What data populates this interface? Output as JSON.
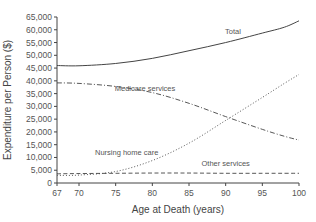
{
  "chart_data": {
    "type": "line",
    "title": "",
    "xlabel": "Age at Death (years)",
    "ylabel": "Expenditure per Person ($)",
    "xlim": [
      67,
      100
    ],
    "ylim": [
      0,
      65000
    ],
    "grid": false,
    "legend": "inline labels",
    "x_ticks": [
      67,
      70,
      75,
      80,
      85,
      90,
      95,
      100
    ],
    "x_tick_labels": [
      "67",
      "70",
      "75",
      "80",
      "85",
      "90",
      "95",
      "100"
    ],
    "y_ticks": [
      0,
      5000,
      10000,
      15000,
      20000,
      25000,
      30000,
      35000,
      40000,
      45000,
      50000,
      55000,
      60000,
      65000
    ],
    "y_tick_labels": [
      "0",
      "5,000",
      "10,000",
      "15,000",
      "20,000",
      "25,000",
      "30,000",
      "35,000",
      "40,000",
      "45,000",
      "50,000",
      "55,000",
      "60,000",
      "65,000"
    ],
    "x": [
      67,
      70,
      75,
      80,
      85,
      90,
      95,
      98,
      100
    ],
    "series": [
      {
        "name": "Total",
        "style": "solid",
        "values": [
          46000,
          45900,
          46800,
          48800,
          51800,
          55000,
          58700,
          61000,
          63500
        ]
      },
      {
        "name": "Medicare services",
        "style": "dash-dot",
        "values": [
          39200,
          39000,
          37800,
          35400,
          31200,
          26000,
          21000,
          18300,
          16800
        ]
      },
      {
        "name": "Nursing home care",
        "style": "dotted",
        "values": [
          3000,
          3100,
          4500,
          8800,
          15600,
          24500,
          33500,
          39000,
          42500
        ]
      },
      {
        "name": "Other services",
        "style": "dashed",
        "values": [
          3600,
          3700,
          3800,
          3900,
          3900,
          3800,
          3800,
          3800,
          3800
        ]
      }
    ],
    "annotations": [
      {
        "text": "Total",
        "x": 91,
        "y": 58500
      },
      {
        "text": "Medicare services",
        "x": 79,
        "y": 36000
      },
      {
        "text": "Nursing home care",
        "x": 76.5,
        "y": 11000
      },
      {
        "text": "Other services",
        "x": 90,
        "y": 6500
      }
    ]
  }
}
